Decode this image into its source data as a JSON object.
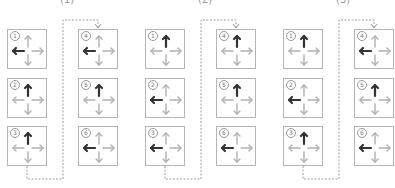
{
  "groups": [
    {
      "label": "(1)",
      "label_x": 60,
      "origin_x": 7,
      "boxes": [
        {
          "num": "1",
          "dark": "left"
        },
        {
          "num": "2",
          "dark": "up"
        },
        {
          "num": "3",
          "dark": "up"
        },
        {
          "num": "4",
          "dark": "left"
        },
        {
          "num": "5",
          "dark": "up"
        },
        {
          "num": "6",
          "dark": "left"
        }
      ]
    },
    {
      "label": "(2)",
      "label_x": 198,
      "origin_x": 145,
      "boxes": [
        {
          "num": "1",
          "dark": "up"
        },
        {
          "num": "2",
          "dark": "left"
        },
        {
          "num": "3",
          "dark": "left"
        },
        {
          "num": "4",
          "dark": "up"
        },
        {
          "num": "5",
          "dark": "up"
        },
        {
          "num": "6",
          "dark": "left"
        }
      ]
    },
    {
      "label": "(3)",
      "label_x": 336,
      "origin_x": 283,
      "boxes": [
        {
          "num": "1",
          "dark": "up"
        },
        {
          "num": "2",
          "dark": "left"
        },
        {
          "num": "3",
          "dark": "up"
        },
        {
          "num": "4",
          "dark": "left"
        },
        {
          "num": "5",
          "dark": "up"
        },
        {
          "num": "6",
          "dark": "left"
        }
      ]
    }
  ],
  "colors": {
    "dark_arrow": "#333333",
    "light_arrow": "#b0b0b0",
    "box_border": "#b5b5b5",
    "connector": "#888888"
  }
}
